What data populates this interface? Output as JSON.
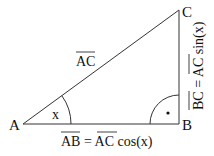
{
  "diagram": {
    "vertices": {
      "A": "A",
      "B": "B",
      "C": "C"
    },
    "angle_label": "x",
    "right_angle_marker": "dot",
    "labels": {
      "hypotenuse": "AC",
      "adjacent": {
        "lhs": "AB",
        "eq": " = ",
        "rhs": "AC",
        "func": " cos(x)"
      },
      "opposite": {
        "lhs": "BC",
        "eq": " = ",
        "rhs": "AC",
        "func": " sin(x)"
      }
    },
    "colors": {
      "stroke": "#333333",
      "text": "#111111"
    }
  }
}
